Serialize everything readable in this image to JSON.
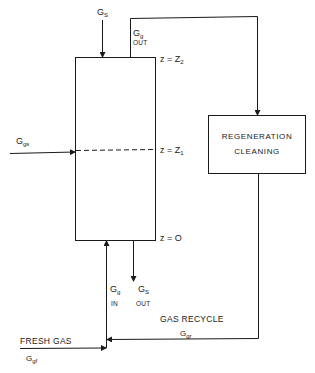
{
  "diagram": {
    "type": "process-flow",
    "stroke_color": "#1a1a1a",
    "background": "#ffffff",
    "column": {
      "labels": {
        "top_level": "z = Z",
        "top_level_sub": "2",
        "mid_level": "z = Z",
        "mid_level_sub": "1",
        "bottom_level": "z = O"
      }
    },
    "streams": {
      "solid_in": {
        "main": "G",
        "sub": "S"
      },
      "gas_out": {
        "main": "G",
        "sub": "g",
        "tag": "OUT"
      },
      "side_gas": {
        "main": "G",
        "sub": "gs"
      },
      "gas_in": {
        "main": "G",
        "sub": "g",
        "tag": "IN"
      },
      "solid_out": {
        "main": "G",
        "sub": "S",
        "tag": "OUT"
      },
      "gas_recycle": {
        "label": "GAS RECYCLE",
        "main": "G",
        "sub": "gr"
      },
      "fresh_gas": {
        "label": "FRESH GAS",
        "main": "G",
        "sub": "gf"
      }
    },
    "regen_box": {
      "line1": "REGENERATION",
      "line2": "CLEANING"
    }
  }
}
